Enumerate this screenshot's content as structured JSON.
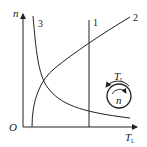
{
  "diagram": {
    "type": "mechanical-load-characteristics",
    "axes": {
      "y_label": "n",
      "x_label": "T",
      "x_label_sub": "L",
      "origin_label": "O"
    },
    "curves": [
      {
        "id": "1",
        "label": "1",
        "shape": "vertical line (constant torque)"
      },
      {
        "id": "2",
        "label": "2",
        "shape": "rising concave curve"
      },
      {
        "id": "3",
        "label": "3",
        "shape": "hyperbola (constant power)"
      }
    ],
    "inset": {
      "torque_label": "T",
      "torque_label_sub": "L",
      "speed_label": "n",
      "description": "rotating shaft circle with opposing arrows"
    },
    "colors": {
      "stroke": "#222222",
      "background": "#ffffff"
    }
  }
}
